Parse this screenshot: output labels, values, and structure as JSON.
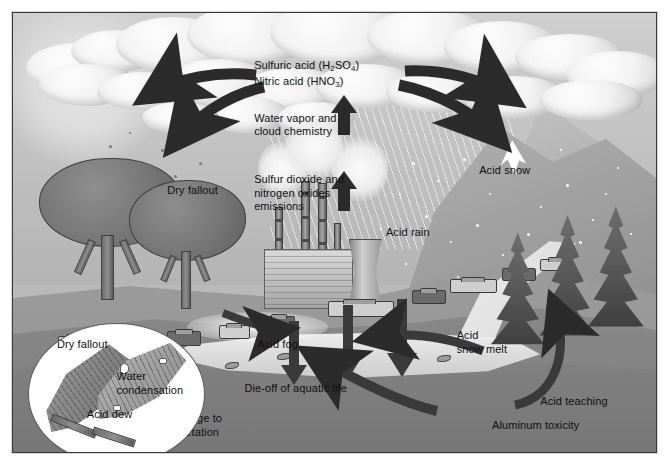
{
  "figure": {
    "palette": {
      "ink": "#101010",
      "frame": "#3a3a3a",
      "arrow_dark": "#2e2e2e",
      "sky": "#c6c6c6",
      "cloud_light": "#f7f7f7",
      "ground": "#8a8a8a",
      "water": "#e0e0e0",
      "inset_bg": "#ffffff"
    }
  },
  "labels": {
    "sulfuric_acid": "Sulfuric acid (H",
    "sulfuric_acid_sub1": "2",
    "sulfuric_acid_mid": "SO",
    "sulfuric_acid_sub2": "4",
    "sulfuric_acid_end": ")",
    "nitric_acid": "Nitric acid (HNO",
    "nitric_acid_sub": "3",
    "nitric_acid_end": ")",
    "water_vapor": "Water vapor and\ncloud chemistry",
    "sulfur_dioxide": "Sulfur dioxide and\nnitrogen oxides\nemissions",
    "dry_fallout_sky": "Dry fallout",
    "acid_snow": "Acid snow",
    "acid_rain": "Acid rain",
    "acid_fog": "Acid fog",
    "acid_snow_melt": "Acid\nsnow melt",
    "die_off": "Die-off of aquatic life",
    "acid_leaching": "Acid teaching",
    "aluminum_toxicity": "Aluminum toxicity",
    "damage_vegetation": "Damage to\nvegetation"
  },
  "inset": {
    "dry_fallout": "Dry fallout",
    "water_condensation": "Water\ncondensation",
    "acid_dew": "Acid dew"
  },
  "scene_elements": {
    "clouds": "cumulus-cloud-bank",
    "factory": "coal-power-plant",
    "cooling_tower": "cooling-tower",
    "smokestacks": 4,
    "deciduous_trees": 2,
    "conifer_trees": 3,
    "mountain_peaks": 2,
    "vehicles": 9,
    "fish": 3,
    "leaves_in_inset": 2
  },
  "arrows": {
    "upward_count": 2,
    "spreading_left_count": 2,
    "spreading_right_count": 2,
    "leaching_down_count": 3,
    "runoff_curved_count": 2,
    "aluminum_curve_count": 1,
    "snowmelt_curve_count": 1
  }
}
